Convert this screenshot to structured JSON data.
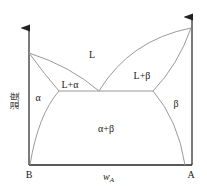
{
  "diagram": {
    "type": "binary eutectic phase diagram",
    "y_axis_label": "温度",
    "x_axis_label": "w",
    "x_axis_subscript": "A",
    "left_end_label": "B",
    "right_end_label": "A",
    "regions": {
      "liquid": "L",
      "liquid_alpha": "L+α",
      "liquid_beta": "L+β",
      "alpha": "α",
      "beta": "β",
      "alpha_beta": "α+β"
    },
    "colors": {
      "axis": "#222222",
      "phase_line": "#9a9a9a",
      "text": "#222222"
    }
  }
}
